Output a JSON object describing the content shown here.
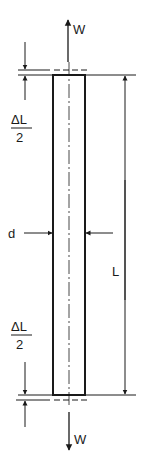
{
  "diagram": {
    "labels": {
      "load_top": "W",
      "load_bottom": "W",
      "diameter": "d",
      "length": "L",
      "delta_top_numerator": "ΔL",
      "delta_top_denominator": "2",
      "delta_bottom_numerator": "ΔL",
      "delta_bottom_denominator": "2"
    },
    "colors": {
      "line": "#1a1a1a",
      "background": "#ffffff"
    }
  }
}
